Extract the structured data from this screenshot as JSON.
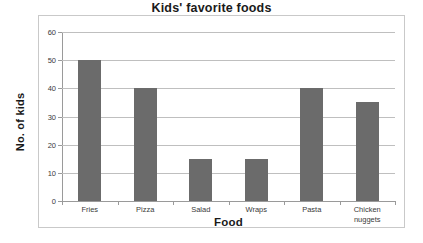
{
  "chart_data": {
    "type": "bar",
    "title": "Kids' favorite foods",
    "xlabel": "Food",
    "ylabel": "No. of kids",
    "categories": [
      "Fries",
      "Pizza",
      "Salad",
      "Wraps",
      "Pasta",
      "Chicken nuggets"
    ],
    "category_lines": [
      [
        "Fries"
      ],
      [
        "Pizza"
      ],
      [
        "Salad"
      ],
      [
        "Wraps"
      ],
      [
        "Pasta"
      ],
      [
        "Chicken",
        "nuggets"
      ]
    ],
    "values": [
      50,
      40,
      15,
      15,
      40,
      35
    ],
    "ylim": [
      0,
      60
    ],
    "ytick_labels": [
      "60",
      "50",
      "40",
      "30",
      "20",
      "10",
      "0"
    ],
    "ytick_values": [
      60,
      50,
      40,
      30,
      20,
      10,
      0
    ],
    "grid": true,
    "legend": false,
    "bar_color": "#6b6b6b",
    "gridline_color": "#bfbfbf",
    "axis_color": "#9a9a9a",
    "frame_color": "#c9c9c9",
    "plot_background": "#ffffff"
  }
}
